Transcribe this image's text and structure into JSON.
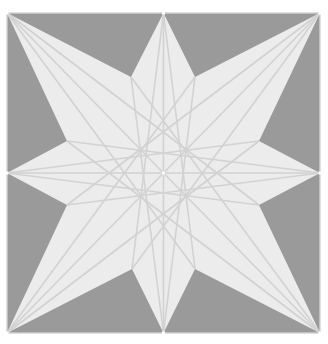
{
  "diagram": {
    "colors": {
      "background": "#ffffff",
      "square_fill": "#9a9a9a",
      "star_fill": "#ececec",
      "line_color": "#d2d2d2",
      "point_color": "#ffffff"
    },
    "square": {
      "x": 7,
      "y": 13,
      "width": 313,
      "height": 320
    },
    "center": [
      163.5,
      173
    ],
    "outer_points": [
      [
        163.5,
        13
      ],
      [
        320,
        13
      ],
      [
        320,
        173
      ],
      [
        320,
        333
      ],
      [
        163.5,
        333
      ],
      [
        7,
        333
      ],
      [
        7,
        173
      ],
      [
        7,
        13
      ]
    ],
    "inner_points": [
      [
        195,
        77
      ],
      [
        259,
        141
      ],
      [
        259,
        205
      ],
      [
        195,
        269
      ],
      [
        132,
        269
      ],
      [
        67,
        205
      ],
      [
        67,
        141
      ],
      [
        131,
        77
      ]
    ]
  }
}
